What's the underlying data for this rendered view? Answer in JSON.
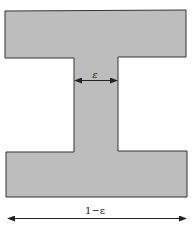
{
  "diagram": {
    "shape": "I-beam cross-section",
    "fill_color": "#bdbdbd",
    "stroke_color": "#333333",
    "web_width_label": "ε",
    "total_width_label": "1−ε"
  }
}
